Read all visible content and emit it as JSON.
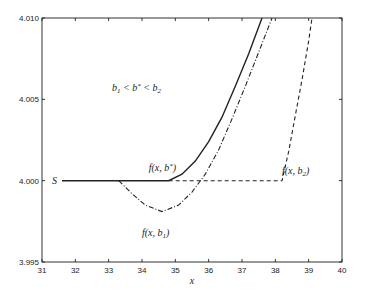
{
  "chart_data": {
    "type": "line",
    "title": "",
    "xlabel": "x",
    "ylabel": "",
    "xlim": [
      31,
      40
    ],
    "ylim": [
      3.995,
      4.01
    ],
    "xticks": [
      "31",
      "32",
      "33",
      "34",
      "35",
      "36",
      "37",
      "38",
      "39",
      "40"
    ],
    "yticks": [
      "3.995",
      "4.000",
      "4.005",
      "4.010"
    ],
    "grid": false,
    "series": [
      {
        "name": "f(x,b*)",
        "style": "solid",
        "x": [
          31.6,
          34.8,
          35.2,
          35.6,
          36.0,
          36.4,
          36.8,
          37.2,
          37.6
        ],
        "y": [
          4.0,
          4.0,
          4.0004,
          4.0012,
          4.0024,
          4.0039,
          4.0058,
          4.0078,
          4.01
        ]
      },
      {
        "name": "f(x,b1)",
        "style": "dashdot",
        "x": [
          33.3,
          33.7,
          34.1,
          34.6,
          35.1,
          35.5,
          35.9,
          36.3,
          36.7,
          37.1,
          37.5,
          37.9
        ],
        "y": [
          4.0,
          3.9992,
          3.9985,
          3.9981,
          3.9985,
          3.9993,
          4.0004,
          4.0019,
          4.0038,
          4.0058,
          4.0079,
          4.01
        ]
      },
      {
        "name": "f(x,b2)",
        "style": "dashed",
        "x": [
          34.8,
          38.2,
          38.4,
          38.6,
          38.8,
          39.0,
          39.1
        ],
        "y": [
          4.0,
          4.0,
          4.0018,
          4.004,
          4.0062,
          4.0086,
          4.01
        ]
      }
    ],
    "annotations": [
      {
        "text": "S",
        "x": 31.3,
        "y": 4.0
      },
      {
        "text": "b1 < b* < b2",
        "x": 33.1,
        "y": 4.0057
      },
      {
        "text": "f(x,b*)",
        "x": 34.2,
        "y": 4.0008
      },
      {
        "text": "f(x,b2)",
        "x": 38.2,
        "y": 4.0006
      },
      {
        "text": "f(x,b1)",
        "x": 34.0,
        "y": 3.9968
      }
    ]
  }
}
